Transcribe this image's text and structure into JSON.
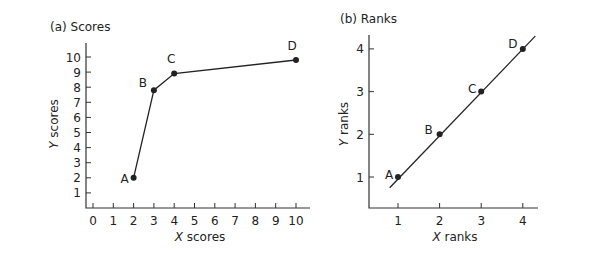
{
  "chart_data": [
    {
      "type": "line",
      "title": "(a) Scores",
      "xlabel": "X scores",
      "ylabel": "Y scores",
      "xlim": [
        0,
        10
      ],
      "ylim": [
        0,
        10.5
      ],
      "xticks": [
        0,
        1,
        2,
        3,
        4,
        5,
        6,
        7,
        8,
        9,
        10
      ],
      "yticks": [
        1,
        2,
        3,
        4,
        5,
        6,
        7,
        8,
        9,
        10
      ],
      "grid": false,
      "points": [
        {
          "label": "A",
          "x": 2,
          "y": 2
        },
        {
          "label": "B",
          "x": 3,
          "y": 7.8
        },
        {
          "label": "C",
          "x": 4,
          "y": 8.9
        },
        {
          "label": "D",
          "x": 10,
          "y": 9.8
        }
      ]
    },
    {
      "type": "line",
      "title": "(b) Ranks",
      "xlabel": "X ranks",
      "ylabel": "Y ranks",
      "xlim": [
        0.3,
        4.4
      ],
      "ylim": [
        0.3,
        4.4
      ],
      "xticks": [
        1,
        2,
        3,
        4
      ],
      "yticks": [
        1,
        2,
        3,
        4
      ],
      "grid": false,
      "points": [
        {
          "label": "A",
          "x": 1,
          "y": 1
        },
        {
          "label": "B",
          "x": 2,
          "y": 2
        },
        {
          "label": "C",
          "x": 3,
          "y": 3
        },
        {
          "label": "D",
          "x": 4,
          "y": 4
        }
      ],
      "line": {
        "type": "straight",
        "from": [
          0.8,
          0.75
        ],
        "to": [
          4.3,
          4.3
        ]
      }
    }
  ]
}
